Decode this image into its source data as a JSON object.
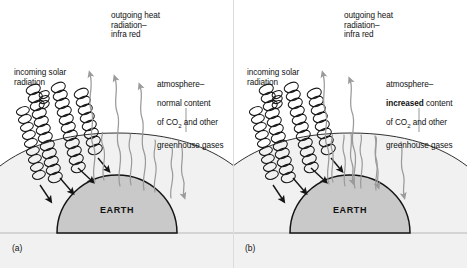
{
  "figure": {
    "background_color": "#ffffff",
    "earth_fill": "#c9c9c9",
    "atmosphere_fill": "#f1f1f1",
    "solar_ray_color": "#1a1a1a",
    "heat_ray_color": "#9a9a9a",
    "outline_color": "#1a1a1a"
  },
  "panels": [
    {
      "tag": "(a)",
      "incoming_label": "incoming solar\nradiation",
      "outgoing_label": "outgoing heat\nradiation–\ninfra red",
      "atmosphere_line1": "atmosphere–",
      "atmosphere_emphasis": "normal",
      "atmosphere_line2": " content",
      "atmosphere_line3_pre": "of CO",
      "atmosphere_line3_sub": "2",
      "atmosphere_line3_post": " and other",
      "atmosphere_line4": "greenhouse gases",
      "earth_label": "EARTH",
      "escaping_rays": 3,
      "reradiated_rays": 1,
      "solar_rays": 4
    },
    {
      "tag": "(b)",
      "incoming_label": "incoming solar\nradiation",
      "outgoing_label": "outgoing heat\nradiation–\ninfra red",
      "atmosphere_line1": "atmosphere–",
      "atmosphere_emphasis": "increased",
      "atmosphere_line2": " content",
      "atmosphere_line3_pre": "of CO",
      "atmosphere_line3_sub": "2",
      "atmosphere_line3_post": " and other",
      "atmosphere_line4": "greenhouse gases",
      "earth_label": "EARTH",
      "escaping_rays": 2,
      "reradiated_rays": 3,
      "solar_rays": 4
    }
  ]
}
